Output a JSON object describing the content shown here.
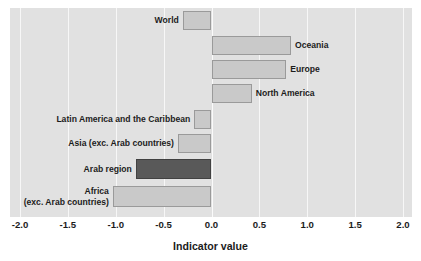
{
  "chart_data": {
    "type": "bar",
    "orientation": "horizontal",
    "title": "",
    "xlabel": "Indicator value",
    "ylabel": "",
    "xlim": [
      -2.0,
      2.0
    ],
    "xticks": [
      "-2.0",
      "-1.5",
      "-1.0",
      "-0.5",
      "0.0",
      "0.5",
      "1.0",
      "1.5",
      "2.0"
    ],
    "xtick_values": [
      -2.0,
      -1.5,
      -1.0,
      -0.5,
      0.0,
      0.5,
      1.0,
      1.5,
      2.0
    ],
    "grid": true,
    "grid_axis": "x",
    "legend": "none",
    "categories": [
      "World",
      "Oceania",
      "Europe",
      "North America",
      "Latin America and the Caribbean",
      "Asia (exc. Arab countries)",
      "Arab region",
      "Africa\n(exc. Arab countries)"
    ],
    "values": [
      -0.3,
      0.83,
      0.78,
      0.42,
      -0.18,
      -0.35,
      -0.79,
      -1.03
    ],
    "highlight_category": "Arab region",
    "colors": {
      "bar": "#c9c9c9",
      "bar_border": "#9a9a9a",
      "highlight_bar": "#595959",
      "highlight_bar_border": "#414141",
      "plot_background": "#e1e1e1",
      "gridline": "#f7f7f7",
      "text": "#1c1c1c",
      "page_background": "#ffffff"
    }
  },
  "axis": {
    "title": "Indicator value"
  },
  "bars": [
    {
      "label": "World",
      "value": -0.3,
      "label_side": "left",
      "highlight": false
    },
    {
      "label": "Oceania",
      "value": 0.83,
      "label_side": "right",
      "highlight": false
    },
    {
      "label": "Europe",
      "value": 0.78,
      "label_side": "right",
      "highlight": false
    },
    {
      "label": "North America",
      "value": 0.42,
      "label_side": "right",
      "highlight": false
    },
    {
      "label": "Latin America and the Caribbean",
      "value": -0.18,
      "label_side": "left",
      "highlight": false
    },
    {
      "label": "Asia (exc. Arab countries)",
      "value": -0.35,
      "label_side": "left",
      "highlight": false
    },
    {
      "label": "Arab region",
      "value": -0.79,
      "label_side": "left",
      "highlight": true
    },
    {
      "label": "Africa\n(exc. Arab countries)",
      "value": -1.03,
      "label_side": "left",
      "highlight": false
    }
  ]
}
